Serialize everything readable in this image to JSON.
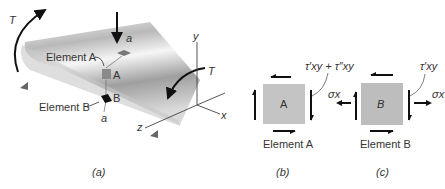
{
  "panel_a": {
    "torque_left": "T",
    "torque_right": "T",
    "section_top": "a",
    "section_bottom": "a",
    "element_a_label": "Element A",
    "element_b_label": "Element B",
    "point_a": "A",
    "point_b": "B",
    "axis_x": "x",
    "axis_y": "y",
    "axis_z": "z",
    "caption": "(a)"
  },
  "panel_b": {
    "element_letter": "A",
    "stress_label": "τ′xy + τ″xy",
    "title": "Element A",
    "caption": "(b)"
  },
  "panel_c": {
    "element_letter": "B",
    "shear_label": "τ′xy",
    "normal_left": "σx",
    "normal_right": "σx",
    "title": "Element B",
    "caption": "(c)"
  },
  "colors": {
    "element_fill": "#bdbdbd",
    "shaft_light": "#e8e8e8",
    "shaft_dark": "#8a8a8a",
    "ink": "#111111"
  }
}
